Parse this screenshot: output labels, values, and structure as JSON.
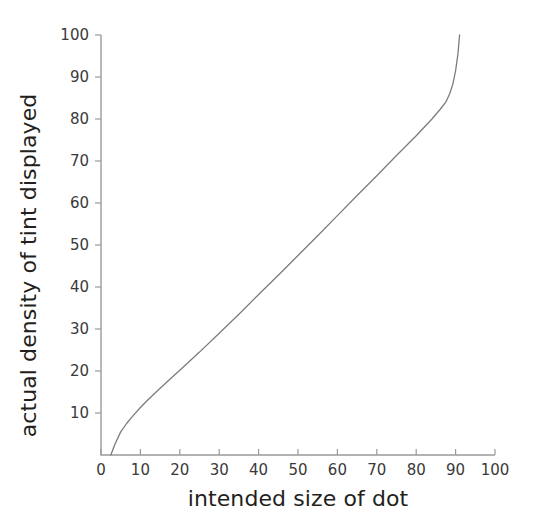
{
  "chart_data": {
    "type": "line",
    "title": "",
    "xlabel": "intended size of dot",
    "ylabel": "actual density of tint displayed",
    "xlim": [
      0,
      100
    ],
    "ylim": [
      0,
      100
    ],
    "grid": false,
    "legend": null,
    "xticks": [
      0,
      10,
      20,
      30,
      40,
      50,
      60,
      70,
      80,
      90,
      100
    ],
    "yticks": [
      10,
      20,
      30,
      40,
      50,
      60,
      70,
      80,
      90,
      100
    ],
    "xtick_labels": [
      "0",
      "10",
      "20",
      "30",
      "40",
      "50",
      "60",
      "70",
      "80",
      "90",
      "100"
    ],
    "ytick_labels": [
      "10",
      "20",
      "30",
      "40",
      "50",
      "60",
      "70",
      "80",
      "90",
      "100"
    ],
    "series": [
      {
        "name": "dot gain curve",
        "color": "#7c7c7c",
        "x": [
          2.5,
          3.5,
          5,
          6.5,
          8,
          10,
          12,
          14,
          17,
          20,
          25,
          30,
          35,
          40,
          45,
          50,
          55,
          60,
          65,
          70,
          75,
          80,
          84,
          86,
          87.5,
          88.5,
          89.3,
          90,
          90.6,
          91
        ],
        "y": [
          0,
          2.5,
          5.5,
          7.5,
          9.2,
          11.3,
          13.2,
          15.0,
          17.6,
          20.2,
          24.5,
          29.0,
          33.5,
          38.2,
          42.8,
          47.5,
          52.2,
          57.0,
          61.8,
          66.5,
          71.3,
          76.0,
          80.0,
          82.2,
          84.0,
          86.0,
          88.3,
          91.5,
          95.5,
          100
        ]
      }
    ]
  },
  "axes": {
    "x_axis_name": "intended size of dot",
    "y_axis_name": "actual density of tint displayed"
  }
}
